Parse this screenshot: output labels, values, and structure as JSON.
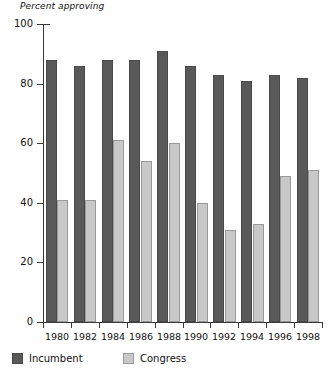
{
  "chart_data": {
    "type": "bar",
    "title": "",
    "ylabel": "Percent approving",
    "xlabel": "",
    "ylim": [
      0,
      100
    ],
    "ytick_labels": [
      "0",
      "20",
      "40",
      "60",
      "80",
      "100"
    ],
    "ytick_values": [
      0,
      20,
      40,
      60,
      80,
      100
    ],
    "grid": false,
    "legend_position": "bottom-left",
    "categories": [
      "1980",
      "1982",
      "1984",
      "1986",
      "1988",
      "1990",
      "1992",
      "1994",
      "1996",
      "1998"
    ],
    "series": [
      {
        "name": "Incumbent",
        "color": "#595959",
        "values": [
          88,
          86,
          88,
          88,
          91,
          86,
          83,
          81,
          83,
          82
        ]
      },
      {
        "name": "Congress",
        "color": "#c8c8c8",
        "values": [
          41,
          41,
          61,
          54,
          60,
          40,
          31,
          33,
          49,
          51
        ]
      }
    ]
  },
  "legend": [
    {
      "label": "Incumbent",
      "swatch": "dark"
    },
    {
      "label": "Congress",
      "swatch": "light"
    }
  ]
}
